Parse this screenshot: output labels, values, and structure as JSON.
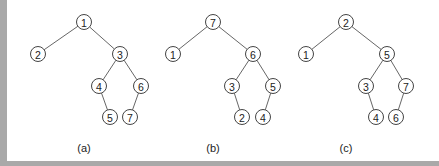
{
  "figure": {
    "trees": [
      {
        "caption": "(a)",
        "nodes": [
          {
            "id": "1",
            "x": 84,
            "y": 22
          },
          {
            "id": "2",
            "x": 38,
            "y": 54
          },
          {
            "id": "3",
            "x": 120,
            "y": 54
          },
          {
            "id": "4",
            "x": 99,
            "y": 86
          },
          {
            "id": "6",
            "x": 141,
            "y": 86
          },
          {
            "id": "5",
            "x": 110,
            "y": 117
          },
          {
            "id": "7",
            "x": 130,
            "y": 117
          }
        ],
        "edges": [
          [
            "1",
            "2"
          ],
          [
            "1",
            "3"
          ],
          [
            "3",
            "4"
          ],
          [
            "3",
            "6"
          ],
          [
            "4",
            "5"
          ],
          [
            "6",
            "7"
          ]
        ],
        "caption_pos": {
          "x": 84,
          "y": 148
        }
      },
      {
        "caption": "(b)",
        "nodes": [
          {
            "id": "7",
            "x": 213,
            "y": 22
          },
          {
            "id": "1",
            "x": 173,
            "y": 54
          },
          {
            "id": "6",
            "x": 253,
            "y": 54
          },
          {
            "id": "3",
            "x": 232,
            "y": 86
          },
          {
            "id": "5",
            "x": 273,
            "y": 86
          },
          {
            "id": "2",
            "x": 242,
            "y": 117
          },
          {
            "id": "4",
            "x": 263,
            "y": 117
          }
        ],
        "edges": [
          [
            "7",
            "1"
          ],
          [
            "7",
            "6"
          ],
          [
            "6",
            "3"
          ],
          [
            "6",
            "5"
          ],
          [
            "3",
            "2"
          ],
          [
            "5",
            "4"
          ]
        ],
        "caption_pos": {
          "x": 213,
          "y": 148
        }
      },
      {
        "caption": "(c)",
        "nodes": [
          {
            "id": "2",
            "x": 346,
            "y": 22
          },
          {
            "id": "1",
            "x": 306,
            "y": 54
          },
          {
            "id": "5",
            "x": 387,
            "y": 54
          },
          {
            "id": "3",
            "x": 366,
            "y": 86
          },
          {
            "id": "7",
            "x": 406,
            "y": 86
          },
          {
            "id": "4",
            "x": 376,
            "y": 117
          },
          {
            "id": "6",
            "x": 396,
            "y": 117
          }
        ],
        "edges": [
          [
            "2",
            "1"
          ],
          [
            "2",
            "5"
          ],
          [
            "5",
            "3"
          ],
          [
            "5",
            "7"
          ],
          [
            "3",
            "4"
          ],
          [
            "7",
            "6"
          ]
        ],
        "caption_pos": {
          "x": 346,
          "y": 148
        }
      }
    ],
    "node_radius": 7.5,
    "colors": {
      "border": "#a9a9a9",
      "stroke": "#444444",
      "text": "#222222"
    }
  }
}
